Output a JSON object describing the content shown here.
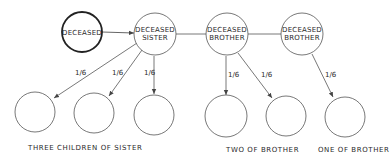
{
  "diagram": {
    "type": "inheritance-flow",
    "colors": {
      "line": "#555555",
      "text": "#2a2a2a",
      "background": "#ffffff"
    },
    "nodes": [
      {
        "id": "deceased",
        "line1": "DECEASED",
        "line2": "",
        "emphasis": true
      },
      {
        "id": "sister",
        "line1": "DECEASED",
        "line2": "SISTER"
      },
      {
        "id": "brother1",
        "line1": "DECEASED",
        "line2": "BROTHER"
      },
      {
        "id": "brother2",
        "line1": "DECEASED",
        "line2": "BROTHER"
      }
    ],
    "children": [
      {
        "id": "sister-child-1",
        "parent": "sister",
        "share": "1/6"
      },
      {
        "id": "sister-child-2",
        "parent": "sister",
        "share": "1/6"
      },
      {
        "id": "sister-child-3",
        "parent": "sister",
        "share": "1/6"
      },
      {
        "id": "brother1-child-1",
        "parent": "brother1",
        "share": "1/6"
      },
      {
        "id": "brother1-child-2",
        "parent": "brother1",
        "share": "1/6"
      },
      {
        "id": "brother2-child-1",
        "parent": "brother2",
        "share": "1/6"
      }
    ],
    "group_labels": [
      "THREE CHILDREN OF SISTER",
      "TWO OF BROTHER",
      "ONE OF BROTHER"
    ]
  }
}
